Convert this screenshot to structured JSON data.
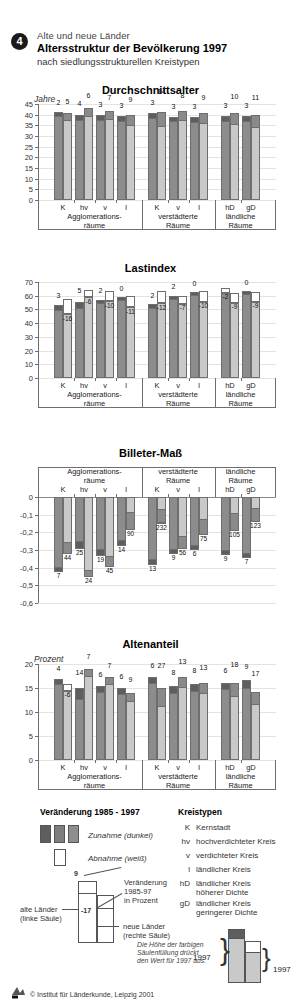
{
  "header": {
    "number": "4",
    "supertitle": "Alte und neue Länder",
    "title": "Altersstruktur der Bevölkerung 1997",
    "subtitle": "nach siedlungsstrukturellen Kreistypen"
  },
  "categories": [
    "K",
    "hv",
    "v",
    "l",
    "K",
    "v",
    "l",
    "hD",
    "gD"
  ],
  "groups": [
    {
      "label": "Agglomerations-\nräume",
      "line1": "Agglomerations-",
      "line2": "räume",
      "span": 4
    },
    {
      "label": "verstädterte\nRäume",
      "line1": "verstädterte",
      "line2": "Räume",
      "span": 3
    },
    {
      "label": "ländliche\nRäume",
      "line1": "ländliche",
      "line2": "Räume",
      "span": 2
    }
  ],
  "colors": {
    "alte_laender": "#8c8c8c",
    "alte_laender_dark": "#5e5e5e",
    "neue_laender": "#c9c9c9",
    "neue_laender_dark": "#8a8a8a",
    "abnahme": "#ffffff",
    "axis": "#6e6e6e",
    "grid": "#e3e3e3"
  },
  "chart_data": [
    {
      "type": "bar",
      "title": "Durchschnittsalter",
      "ylabel": "Jahre",
      "xlabel": "",
      "ylim": [
        0,
        45
      ],
      "yticks": [
        0,
        5,
        10,
        15,
        20,
        25,
        30,
        35,
        40,
        45
      ],
      "grid": true,
      "categories": [
        "K",
        "hv",
        "v",
        "l",
        "K",
        "v",
        "l",
        "hD",
        "gD"
      ],
      "series": [
        {
          "name": "alte Länder",
          "values": [
            41.2,
            40.0,
            39.9,
            39.3,
            40.8,
            39.1,
            38.9,
            39.4,
            39.3
          ]
        },
        {
          "name": "neue Länder",
          "values": [
            40.6,
            42.9,
            41.7,
            40.0,
            41.3,
            41.9,
            40.6,
            40.6,
            40.0
          ]
        }
      ],
      "change_labels": {
        "alte_laender": [
          "2",
          "4",
          "3",
          "3",
          "3",
          "3",
          "3",
          "3",
          "3"
        ],
        "neue_laender": [
          "5",
          "6",
          "7",
          "9",
          "14",
          "8",
          "9",
          "10",
          "11"
        ]
      }
    },
    {
      "type": "bar",
      "title": "Lastindex",
      "ylabel": "",
      "xlabel": "",
      "ylim": [
        0,
        70
      ],
      "yticks": [
        0,
        10,
        20,
        30,
        40,
        50,
        60,
        70
      ],
      "grid": true,
      "categories": [
        "K",
        "hv",
        "v",
        "l",
        "K",
        "v",
        "l",
        "hD",
        "gD"
      ],
      "series": [
        {
          "name": "alte Länder",
          "values": [
            53.0,
            55.5,
            57.0,
            59.2,
            53.8,
            60.0,
            62.5,
            62.0,
            63.5
          ]
        },
        {
          "name": "neue Länder",
          "values": [
            46.5,
            59.0,
            56.0,
            51.5,
            54.5,
            54.0,
            55.5,
            55.0,
            55.5
          ]
        }
      ],
      "change_labels": {
        "alte_laender": [
          "3",
          "5",
          "2",
          "0",
          "2",
          "2",
          "0",
          "-2",
          "0"
        ],
        "neue_laender": [
          "-16",
          "-6",
          "-10",
          "-11",
          "-12",
          "-7",
          "-10",
          "-9",
          "-9"
        ]
      }
    },
    {
      "type": "bar",
      "title": "Billeter-Maß",
      "ylabel": "",
      "xlabel": "",
      "ylim": [
        -0.6,
        0
      ],
      "yticks": [
        0,
        -0.1,
        -0.2,
        -0.3,
        -0.4,
        -0.5,
        -0.6
      ],
      "grid": true,
      "categories": [
        "K",
        "hv",
        "v",
        "l",
        "K",
        "v",
        "l",
        "hD",
        "gD"
      ],
      "series": [
        {
          "name": "alte Länder",
          "values": [
            -0.425,
            -0.295,
            -0.335,
            -0.28,
            -0.385,
            -0.325,
            -0.3,
            -0.33,
            -0.345
          ]
        },
        {
          "name": "neue Länder",
          "values": [
            -0.32,
            -0.455,
            -0.395,
            -0.185,
            -0.15,
            -0.295,
            -0.215,
            -0.195,
            -0.14
          ]
        }
      ],
      "change_labels": {
        "alte_laender": [
          "7",
          "25",
          "19",
          "14",
          "13",
          "9",
          "6",
          "9",
          "7"
        ],
        "neue_laender": [
          "44",
          "24",
          "45",
          "90",
          "232",
          "56",
          "75",
          "105",
          "123"
        ]
      }
    },
    {
      "type": "bar",
      "title": "Altenanteil",
      "ylabel": "Prozent",
      "xlabel": "",
      "ylim": [
        0,
        20
      ],
      "yticks": [
        0,
        5,
        10,
        15,
        20
      ],
      "grid": true,
      "categories": [
        "K",
        "hv",
        "v",
        "l",
        "K",
        "v",
        "l",
        "hD",
        "gD"
      ],
      "series": [
        {
          "name": "alte Länder",
          "values": [
            16.9,
            14.9,
            15.4,
            15.0,
            17.3,
            15.5,
            15.9,
            16.1,
            16.7
          ]
        },
        {
          "name": "neue Länder",
          "values": [
            14.4,
            18.9,
            17.2,
            13.9,
            14.9,
            17.3,
            16.0,
            16.1,
            14.2
          ]
        }
      ],
      "change_labels": {
        "alte_laender": [
          "4",
          "14",
          "6",
          "6",
          "6",
          "8",
          "8",
          "6",
          "9"
        ],
        "neue_laender": [
          "-6",
          "7",
          "7",
          "9",
          "27",
          "13",
          "13",
          "18",
          "17"
        ]
      }
    }
  ],
  "legend": {
    "change_title": "Veränderung 1985 - 1997",
    "zunahme": "Zunahme (dunkel)",
    "abnahme": "Abnahme (weiß)",
    "callout_value": "9",
    "callout_value_neg": "-17",
    "callout_text_l1": "Veränderung",
    "callout_text_l2": "1985-97",
    "callout_text_l3": "in Prozent",
    "alte_l1": "alte Länder",
    "alte_l2": "(linke Säule)",
    "neue_l1": "neue Länder",
    "neue_l2": "(rechte Säule)",
    "note_l1": "Die Höhe der farbigen",
    "note_l2": "Säulenfüllung drückt",
    "note_l3": "den Wert für 1997 aus.",
    "year_left": "1997",
    "year_right": "1997",
    "kreistypen_title": "Kreistypen",
    "kreistypen": [
      {
        "key": "K",
        "l1": "Kernstadt",
        "l2": ""
      },
      {
        "key": "hv",
        "l1": "hochverdichteter Kreis",
        "l2": ""
      },
      {
        "key": "v",
        "l1": "verdichteter Kreis",
        "l2": ""
      },
      {
        "key": "l",
        "l1": "ländlicher Kreis",
        "l2": ""
      },
      {
        "key": "hD",
        "l1": "ländlicher Kreis",
        "l2": "höherer Dichte"
      },
      {
        "key": "gD",
        "l1": "ländlicher Kreis",
        "l2": "geringerer Dichte"
      }
    ],
    "copyright": "© Institut für Länderkunde, Leipzig 2001"
  }
}
